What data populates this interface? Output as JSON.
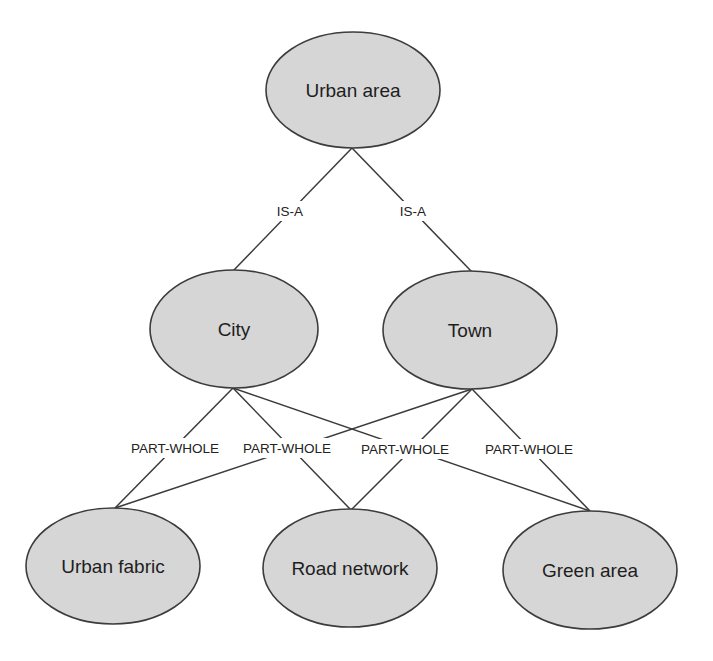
{
  "diagram": {
    "type": "concept-hierarchy",
    "colors": {
      "node_fill": "#d6d6d6",
      "node_stroke": "#3c3c3c",
      "edge": "#3a3a3a",
      "text": "#1e1e1e",
      "background": "#ffffff"
    },
    "nodes": [
      {
        "id": "urban_area",
        "label": "Urban area",
        "cx": 353,
        "cy": 90,
        "rx": 87,
        "ry": 58
      },
      {
        "id": "city",
        "label": "City",
        "cx": 234,
        "cy": 329,
        "rx": 84,
        "ry": 59
      },
      {
        "id": "town",
        "label": "Town",
        "cx": 470,
        "cy": 330,
        "rx": 87,
        "ry": 59
      },
      {
        "id": "urban_fabric",
        "label": "Urban fabric",
        "cx": 113,
        "cy": 566,
        "rx": 87,
        "ry": 58
      },
      {
        "id": "road_network",
        "label": "Road network",
        "cx": 350,
        "cy": 568,
        "rx": 87,
        "ry": 59
      },
      {
        "id": "green_area",
        "label": "Green area",
        "cx": 590,
        "cy": 570,
        "rx": 87,
        "ry": 59
      }
    ],
    "edges": [
      {
        "from": "urban_area",
        "to": "city",
        "label": "IS-A",
        "x1": 352,
        "y1": 148,
        "x2": 233,
        "y2": 271
      },
      {
        "from": "urban_area",
        "to": "town",
        "label": "IS-A",
        "x1": 352,
        "y1": 148,
        "x2": 472,
        "y2": 272
      },
      {
        "from": "city",
        "to": "urban_fabric",
        "label": "PART-WHOLE",
        "x1": 233,
        "y1": 388,
        "x2": 115,
        "y2": 508
      },
      {
        "from": "city",
        "to": "road_network",
        "label": "PART-WHOLE",
        "x1": 233,
        "y1": 388,
        "x2": 351,
        "y2": 510
      },
      {
        "from": "city",
        "to": "green_area",
        "label": "PART-WHOLE",
        "x1": 233,
        "y1": 388,
        "x2": 590,
        "y2": 511
      },
      {
        "from": "town",
        "to": "urban_fabric",
        "label": "PART-WHOLE",
        "x1": 472,
        "y1": 389,
        "x2": 115,
        "y2": 508
      },
      {
        "from": "town",
        "to": "road_network",
        "label": "PART-WHOLE",
        "x1": 472,
        "y1": 389,
        "x2": 351,
        "y2": 510
      },
      {
        "from": "town",
        "to": "green_area",
        "label": "PART-WHOLE",
        "x1": 472,
        "y1": 389,
        "x2": 590,
        "y2": 511
      }
    ],
    "edge_labels": [
      {
        "text": "IS-A",
        "x": 290,
        "y": 211,
        "w": 40
      },
      {
        "text": "IS-A",
        "x": 413,
        "y": 211,
        "w": 40
      },
      {
        "text": "PART-WHOLE",
        "x": 175,
        "y": 448,
        "w": 108
      },
      {
        "text": "PART-WHOLE",
        "x": 287,
        "y": 448,
        "w": 108
      },
      {
        "text": "PART-WHOLE",
        "x": 405,
        "y": 449,
        "w": 108
      },
      {
        "text": "PART-WHOLE",
        "x": 529,
        "y": 449,
        "w": 108
      }
    ]
  }
}
